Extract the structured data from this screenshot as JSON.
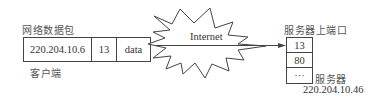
{
  "client": {
    "packet_title": "网络数据包",
    "packet_fields": [
      "220.204.10.6",
      "13",
      "data"
    ],
    "label": "客户端"
  },
  "network": {
    "label": "Internet"
  },
  "server": {
    "ports_title": "服务器上端口",
    "ports": [
      "13",
      "80",
      "···"
    ],
    "label": "服务器",
    "ip": "220.204.10.46"
  },
  "colors": {
    "stroke": "#444444",
    "text": "#333333"
  }
}
